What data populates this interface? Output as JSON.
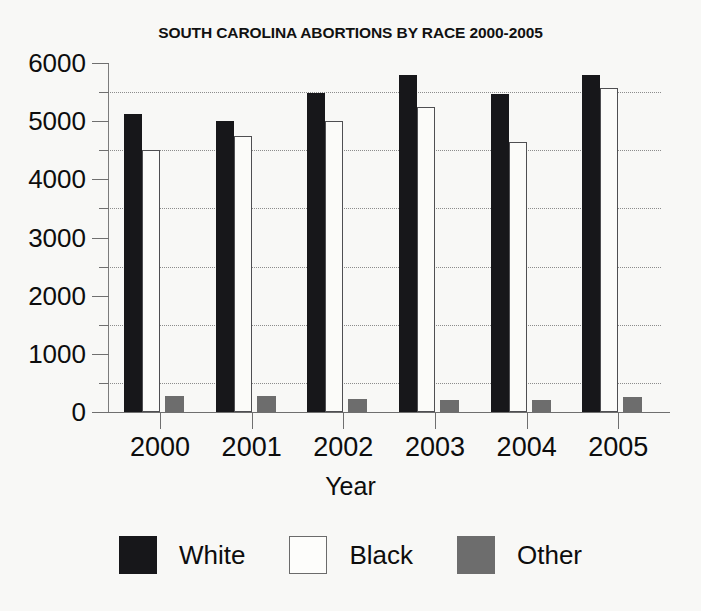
{
  "chart_data": {
    "type": "bar",
    "title": "SOUTH CAROLINA ABORTIONS BY RACE 2000-2005",
    "xlabel": "Year",
    "ylabel": "",
    "categories": [
      "2000",
      "2001",
      "2002",
      "2003",
      "2004",
      "2005"
    ],
    "series": [
      {
        "name": "White",
        "color": "#17171a",
        "values": [
          5130,
          5010,
          5480,
          5800,
          5460,
          5800
        ]
      },
      {
        "name": "Black",
        "color": "#ffffff",
        "values": [
          4500,
          4750,
          5000,
          5250,
          4650,
          5570
        ]
      },
      {
        "name": "Other",
        "color": "#6d6d6d",
        "values": [
          270,
          270,
          230,
          215,
          200,
          250
        ]
      }
    ],
    "ylim": [
      0,
      6000
    ],
    "ytick_labels": [
      "0",
      "1000",
      "2000",
      "3000",
      "4000",
      "5000",
      "6000"
    ],
    "ytick_values": [
      0,
      1000,
      2000,
      3000,
      4000,
      5000,
      6000
    ],
    "minor_tick_values": [
      500,
      1500,
      2500,
      3500,
      4500,
      5500
    ],
    "gridline_values": [
      500,
      1500,
      2500,
      3500,
      4500,
      5500
    ],
    "grid": true,
    "legend_position": "bottom",
    "legend": [
      {
        "label": "White",
        "swatch": "solid-black"
      },
      {
        "label": "Black",
        "swatch": "outlined-white"
      },
      {
        "label": "Other",
        "swatch": "solid-gray"
      }
    ]
  }
}
